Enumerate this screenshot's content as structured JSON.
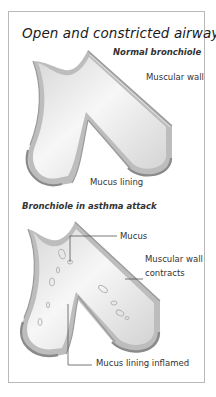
{
  "title": "Open and constricted airway",
  "panels": [
    {
      "subtitle": "Normal bronchiole",
      "labels": {
        "muscular_wall": "Muscular wall",
        "mucus_lining": "Mucus lining"
      }
    },
    {
      "subtitle": "Bronchiole in asthma attack",
      "labels": {
        "mucus": "Mucus",
        "muscular_wall_line1": "Muscular wall",
        "muscular_wall_line2": "contracts",
        "mucus_lining_inflamed": "Mucus lining inflamed"
      }
    }
  ],
  "colors": {
    "border": "#b9b9b9",
    "tube_fill": "#e9e9e9",
    "tube_wall_dark": "#8a8a8a",
    "tube_wall_light": "#cfcfcf",
    "leader_line": "#555555"
  }
}
